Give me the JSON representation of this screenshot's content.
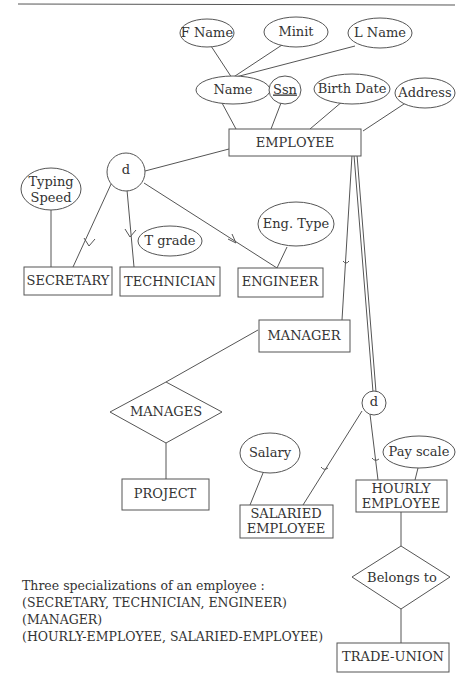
{
  "diagram": {
    "entities": {
      "employee": "EMPLOYEE",
      "secretary": "SECRETARY",
      "technician": "TECHNICIAN",
      "engineer": "ENGINEER",
      "manager": "MANAGER",
      "project": "PROJECT",
      "salaried_employee_1": "SALARIED",
      "salaried_employee_2": "EMPLOYEE",
      "hourly_employee_1": "HOURLY",
      "hourly_employee_2": "EMPLOYEE",
      "trade_union": "TRADE-UNION"
    },
    "attributes": {
      "fname": "F Name",
      "minit": "Minit",
      "lname": "L Name",
      "name": "Name",
      "ssn": "Ssn",
      "birth_date": "Birth Date",
      "address": "Address",
      "typing_speed_1": "Typing",
      "typing_speed_2": "Speed",
      "t_grade": "T grade",
      "eng_type": "Eng. Type",
      "salary": "Salary",
      "pay_scale": "Pay scale"
    },
    "relationships": {
      "manages": "MANAGES",
      "belongs_to": "Belongs to"
    },
    "specialization_circles": {
      "employee_job_type": "d",
      "employee_pay_method": "d"
    }
  },
  "caption": {
    "line1": "Three specializations of an employee :",
    "line2": "(SECRETARY, TECHNICIAN, ENGINEER)",
    "line3": "(MANAGER)",
    "line4": "(HOURLY-EMPLOYEE, SALARIED-EMPLOYEE)"
  }
}
